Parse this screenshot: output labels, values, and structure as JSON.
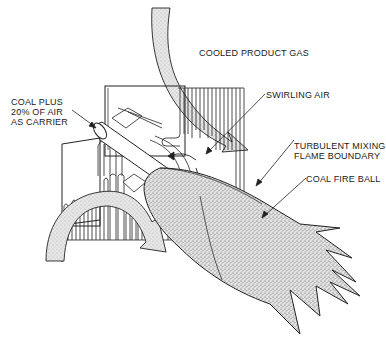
{
  "diagram": {
    "colors": {
      "ink": "#222222",
      "stipple_fill": "#d8d8d8",
      "background": "#ffffff"
    },
    "labels": {
      "cooled_product_gas": "COOLED PRODUCT GAS",
      "coal_plus_line1": "COAL PLUS",
      "coal_plus_line2": "20% OF AIR",
      "coal_plus_line3": "AS CARRIER",
      "swirling_air": "SWIRLING AIR",
      "turbulent_line1": "TURBULENT MIXING",
      "turbulent_line2": "FLAME BOUNDARY",
      "coal_fire_ball": "COAL FIRE BALL"
    },
    "components": [
      "cooled-product-gas-flow-arrow",
      "burner-housing",
      "water-wall-tubes",
      "coal-injection-pipe",
      "swirl-vanes",
      "recirculation-flow-arrow",
      "coal-fire-ball-flame"
    ]
  }
}
